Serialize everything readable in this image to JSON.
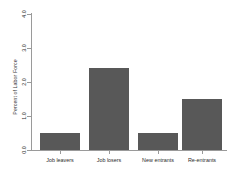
{
  "chart_data": {
    "type": "bar",
    "title": "",
    "subtitle": "",
    "xlabel": "",
    "ylabel": "Percent of Labor Force",
    "categories": [
      "Job leavers",
      "Job losers",
      "New entrants",
      "Re-entrants"
    ],
    "values": [
      0.5,
      2.4,
      0.5,
      1.5
    ],
    "series": [
      {
        "name": "Percent of Labor Force",
        "values": [
          0.5,
          2.4,
          0.5,
          1.5
        ]
      }
    ],
    "ylim": [
      0.0,
      4.0
    ],
    "ytick_values": [
      0.0,
      1.0,
      2.0,
      3.0,
      4.0
    ],
    "ytick_labels": [
      "0.0",
      "1.0",
      "2.0",
      "3.0",
      "4.0"
    ],
    "grid": false,
    "legend": false,
    "legend_position": "none",
    "bar_color": "#585858",
    "axis_color": "#9a9a9a",
    "background_color": "#ffffff"
  }
}
